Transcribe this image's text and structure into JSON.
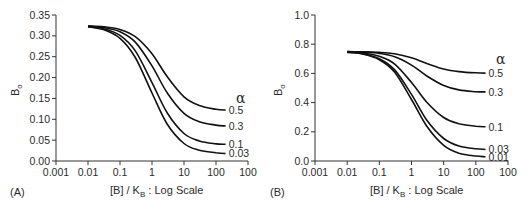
{
  "chart_data": [
    {
      "type": "line",
      "panel_label": "(A)",
      "title": "",
      "xlabel": "[B] / K_B : Log Scale",
      "xlabel_parts": {
        "pre": "[B] / K",
        "sub": "B",
        "post": " : Log Scale"
      },
      "ylabel": "B_o",
      "ylabel_parts": {
        "main": "B",
        "sub": "o"
      },
      "xscale": "log",
      "xlim": [
        0.001,
        1000
      ],
      "ylim": [
        0.0,
        0.35
      ],
      "x_ticks": [
        0.001,
        0.01,
        0.1,
        1,
        10,
        100,
        1000
      ],
      "x_tick_labels": [
        "0.001",
        "0.01",
        "0.1",
        "1",
        "10",
        "100",
        "100"
      ],
      "y_ticks": [
        0.0,
        0.05,
        0.1,
        0.15,
        0.2,
        0.25,
        0.3,
        0.35
      ],
      "y_tick_labels": [
        "0.00",
        "0.05",
        "0.10",
        "0.15",
        "0.20",
        "0.25",
        "0.30",
        "0.35"
      ],
      "legend_title": "α",
      "legend_position": "right, inline at curve ends",
      "grid": false,
      "x": [
        0.01,
        0.03,
        0.1,
        0.3,
        1,
        3,
        10,
        30,
        100,
        200
      ],
      "series": [
        {
          "name": "0.5",
          "values": [
            0.324,
            0.322,
            0.315,
            0.298,
            0.257,
            0.202,
            0.154,
            0.133,
            0.124,
            0.122
          ]
        },
        {
          "name": "0.3",
          "values": [
            0.323,
            0.32,
            0.31,
            0.285,
            0.228,
            0.163,
            0.114,
            0.094,
            0.086,
            0.084
          ]
        },
        {
          "name": "0.1",
          "values": [
            0.322,
            0.317,
            0.301,
            0.264,
            0.188,
            0.115,
            0.066,
            0.048,
            0.041,
            0.04
          ]
        },
        {
          "name": "0.03",
          "values": [
            0.322,
            0.315,
            0.294,
            0.248,
            0.163,
            0.088,
            0.042,
            0.026,
            0.02,
            0.018
          ]
        }
      ]
    },
    {
      "type": "line",
      "panel_label": "(B)",
      "title": "",
      "xlabel": "[B] / K_B : Log Scale",
      "xlabel_parts": {
        "pre": "[B] / K",
        "sub": "B",
        "post": " : Log Scale"
      },
      "ylabel": "B_o",
      "ylabel_parts": {
        "main": "B",
        "sub": "o"
      },
      "xscale": "log",
      "xlim": [
        0.001,
        1000
      ],
      "ylim": [
        0.0,
        1.0
      ],
      "x_ticks": [
        0.001,
        0.01,
        0.1,
        1,
        10,
        100,
        1000
      ],
      "x_tick_labels": [
        "0.001",
        "0.01",
        "0.1",
        "1",
        "10",
        "100",
        "100"
      ],
      "y_ticks": [
        0.0,
        0.2,
        0.4,
        0.6,
        0.8,
        1.0
      ],
      "y_tick_labels": [
        "0.0",
        "0.2",
        "0.4",
        "0.6",
        "0.8",
        "1.0"
      ],
      "legend_title": "α",
      "legend_position": "right, inline at curve ends",
      "grid": false,
      "x": [
        0.01,
        0.03,
        0.1,
        0.3,
        1,
        3,
        10,
        30,
        100,
        200
      ],
      "series": [
        {
          "name": "0.5",
          "values": [
            0.749,
            0.748,
            0.744,
            0.734,
            0.707,
            0.668,
            0.63,
            0.612,
            0.604,
            0.602
          ]
        },
        {
          "name": "0.3",
          "values": [
            0.749,
            0.746,
            0.737,
            0.714,
            0.657,
            0.582,
            0.517,
            0.487,
            0.475,
            0.473
          ]
        },
        {
          "name": "0.1",
          "values": [
            0.747,
            0.74,
            0.717,
            0.664,
            0.538,
            0.403,
            0.298,
            0.255,
            0.238,
            0.234
          ]
        },
        {
          "name": "0.03",
          "values": [
            0.745,
            0.735,
            0.701,
            0.624,
            0.456,
            0.279,
            0.154,
            0.103,
            0.084,
            0.079
          ]
        },
        {
          "name": "0.01",
          "values": [
            0.744,
            0.733,
            0.694,
            0.608,
            0.421,
            0.238,
            0.107,
            0.053,
            0.034,
            0.029
          ]
        }
      ]
    }
  ],
  "style": {
    "line_color": "#111111",
    "axis_color": "#333333",
    "background": "#ffffff"
  }
}
